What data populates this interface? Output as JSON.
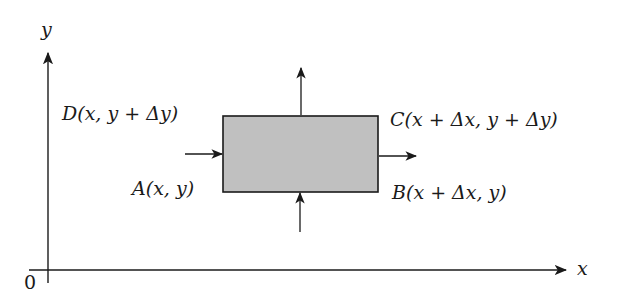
{
  "diagram": {
    "type": "control-volume element",
    "axes": {
      "x_label": "x",
      "y_label": "y",
      "origin_label": "0"
    },
    "element": {
      "fill_color": "#c0c0c0",
      "stroke_color": "#1a1a1a"
    },
    "corners": {
      "A": "A(x, y)",
      "B": "B(x + Δx, y)",
      "C": "C(x + Δx, y + Δy)",
      "D": "D(x, y + Δy)"
    },
    "flux_arrows": [
      {
        "side": "left",
        "direction": "in"
      },
      {
        "side": "right",
        "direction": "out"
      },
      {
        "side": "bottom",
        "direction": "in"
      },
      {
        "side": "top",
        "direction": "out"
      }
    ]
  }
}
